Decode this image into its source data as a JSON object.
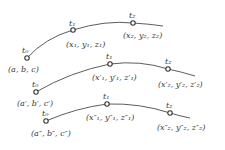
{
  "diagram": {
    "curves": [
      {
        "points": [
          {
            "param": "t₀",
            "coords": "(a, b, c)"
          },
          {
            "param": "t₁",
            "coords": "(x₁, y₁, z₁)"
          },
          {
            "param": "t₂",
            "coords": "(x₂, y₂, z₂)"
          }
        ]
      },
      {
        "points": [
          {
            "param": "t₀",
            "coords": "(a′, b′, c′)"
          },
          {
            "param": "t₁",
            "coords": "(x′₁, y′₁, z′₁)"
          },
          {
            "param": "t₂",
            "coords": "(x′₂, y′₂, z′₂)"
          }
        ]
      },
      {
        "points": [
          {
            "param": "t₀",
            "coords": "(a″, b″, c″)"
          },
          {
            "param": "t₁",
            "coords": "(x″₁, y″₁, z″₁)"
          },
          {
            "param": "t₂",
            "coords": "(x″₂, y″₂, z″₂)"
          }
        ]
      }
    ]
  }
}
